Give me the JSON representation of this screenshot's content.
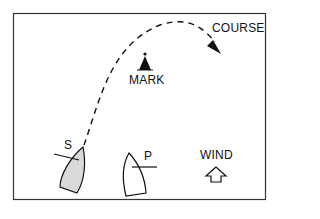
{
  "diagram": {
    "labels": {
      "course": "COURSE",
      "mark": "MARK",
      "starboard_boat": "S",
      "port_boat": "P",
      "wind": "WIND"
    },
    "colors": {
      "line": "#111111",
      "border": "#333333",
      "starboard_fill": "#d9d9d9",
      "port_fill": "#ffffff",
      "background": "#ffffff"
    }
  }
}
